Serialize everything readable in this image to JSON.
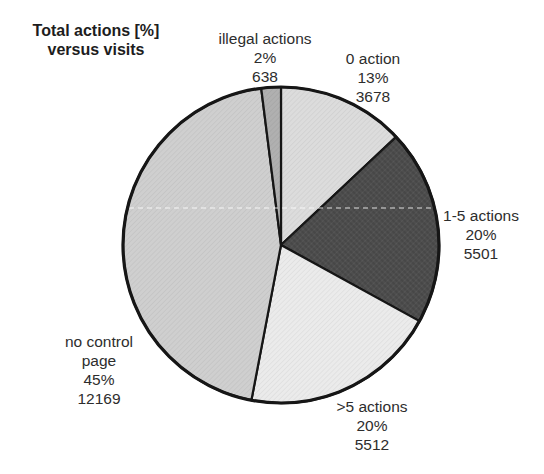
{
  "page": {
    "background_color": "#ffffff",
    "ink_color": "#2d2d2d"
  },
  "chart_data": {
    "type": "pie",
    "title_lines": [
      "Total actions [%]",
      "versus visits"
    ],
    "legend_position": "none",
    "label_format": "category, percent, count",
    "start_angle": "12 o'clock, clockwise",
    "outline_color": "#161616",
    "slices": [
      {
        "label": "0 action",
        "pct": 13,
        "count": 3678,
        "color": "#dcdcdc",
        "lines": [
          "0 action",
          "13%",
          "3678"
        ]
      },
      {
        "label": "1-5 actions",
        "pct": 20,
        "count": 5501,
        "color": "#4e4e4e",
        "lines": [
          "1-5 actions",
          "20%",
          "5501"
        ]
      },
      {
        "label": ">5 actions",
        "pct": 20,
        "count": 5512,
        "color": "#ebebeb",
        "lines": [
          ">5 actions",
          "20%",
          "5512"
        ]
      },
      {
        "label": "no control page",
        "pct": 45,
        "count": 12169,
        "color": "#cfcfcf",
        "lines": [
          "no control",
          "page",
          "45%",
          "12169"
        ]
      },
      {
        "label": "illegal actions",
        "pct": 2,
        "count": 638,
        "color": "#b0b0b0",
        "lines": [
          "illegal actions",
          "2%",
          "638"
        ]
      }
    ]
  }
}
